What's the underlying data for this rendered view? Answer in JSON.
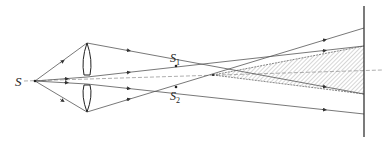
{
  "diagram": {
    "colors": {
      "ray": "#555555",
      "screen": "#333333",
      "hatch": "#888888",
      "label": "#222222"
    },
    "labels": {
      "source": "S",
      "image1_main": "S",
      "image1_sub": "1",
      "image2_main": "S",
      "image2_sub": "2"
    },
    "elements": [
      {
        "name": "point-source",
        "label": "S"
      },
      {
        "name": "split-lens",
        "halves": 2
      },
      {
        "name": "virtual-source-1",
        "label": "S1"
      },
      {
        "name": "virtual-source-2",
        "label": "S2"
      },
      {
        "name": "interference-region",
        "style": "hatched"
      },
      {
        "name": "screen"
      }
    ]
  }
}
